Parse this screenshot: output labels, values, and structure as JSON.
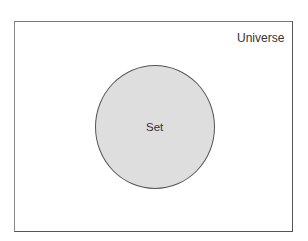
{
  "diagram": {
    "type": "venn",
    "universe": {
      "label": "Universe"
    },
    "sets": [
      {
        "label": "Set",
        "fill": "#dedede"
      }
    ]
  }
}
